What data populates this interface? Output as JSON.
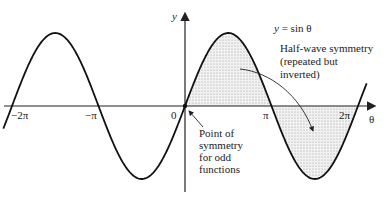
{
  "diagram": {
    "function_label": "y = sin θ",
    "axes": {
      "x_label": "θ",
      "y_label": "y",
      "ticks": [
        {
          "label": "−2π",
          "value": -6.2832
        },
        {
          "label": "−π",
          "value": -3.1416
        },
        {
          "label": "0",
          "value": 0
        },
        {
          "label": "π",
          "value": 3.1416
        },
        {
          "label": "2π",
          "value": 6.2832
        }
      ]
    },
    "annotations": {
      "half_wave_line1": "Half-wave symmetry",
      "half_wave_line2": "(repeated but",
      "half_wave_line3": "inverted)",
      "point_line1": "Point of",
      "point_line2": "symmetry",
      "point_line3": "for odd",
      "point_line4": "functions"
    },
    "colors": {
      "curve": "#111111",
      "axis": "#222222",
      "shading": "#cccccc"
    }
  }
}
